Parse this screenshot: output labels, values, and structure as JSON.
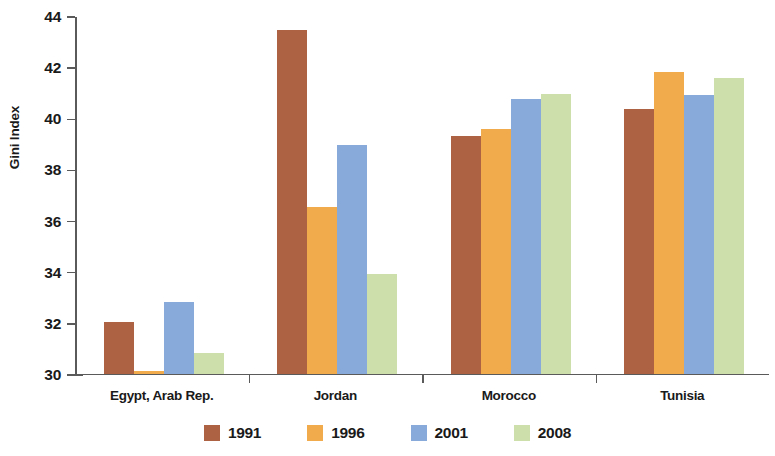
{
  "chart_data": {
    "type": "bar",
    "title": "",
    "subtitle": "",
    "xlabel": "",
    "ylabel": "Gini Index",
    "ylim": [
      30,
      44
    ],
    "ytick_step": 2,
    "yticks": [
      30,
      32,
      34,
      36,
      38,
      40,
      42,
      44
    ],
    "ytick_labels": [
      "30",
      "32",
      "34",
      "36",
      "38",
      "40",
      "42",
      "44"
    ],
    "grid": false,
    "legend_position": "bottom",
    "categories": [
      "Egypt, Arab Rep.",
      "Jordan",
      "Morocco",
      "Tunisia"
    ],
    "series": [
      {
        "name": "1991",
        "color": "#ad6243",
        "values": [
          32.0,
          43.45,
          39.3,
          40.35
        ]
      },
      {
        "name": "1996",
        "color": "#f2ab4c",
        "values": [
          30.1,
          36.5,
          39.55,
          41.8
        ]
      },
      {
        "name": "2001",
        "color": "#88aadb",
        "values": [
          32.8,
          38.95,
          40.75,
          40.9
        ]
      },
      {
        "name": "2008",
        "color": "#cddfab",
        "values": [
          30.8,
          33.9,
          40.95,
          41.55
        ]
      }
    ]
  },
  "axis": {
    "y_title": "Gini Index"
  },
  "legend": {
    "items": [
      {
        "label": "1991",
        "color": "#ad6243"
      },
      {
        "label": "1996",
        "color": "#f2ab4c"
      },
      {
        "label": "2001",
        "color": "#88aadb"
      },
      {
        "label": "2008",
        "color": "#cddfab"
      }
    ]
  },
  "colors": {
    "axis": "#5a5a5a",
    "text": "#1a1a1a",
    "background": "#ffffff"
  }
}
